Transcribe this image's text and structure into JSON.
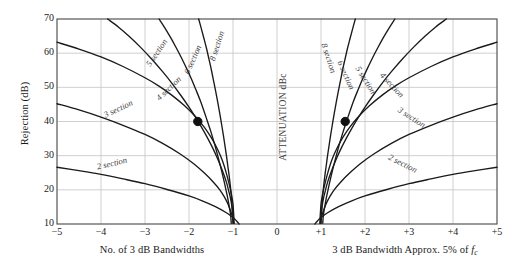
{
  "figure": {
    "center_annotation": "ATTENUATION dBc",
    "ylabel": "Rejection (dB)",
    "xlabel_left": "No. of 3 dB Bandwidths",
    "xlabel_right_pre": "3 dB Bandwidth Approx. 5% of ",
    "xlabel_right_italic": "f",
    "xlabel_right_sub": "c"
  },
  "chart_data": {
    "type": "line",
    "title": "",
    "xlabel": "No. of 3 dB Bandwidths / 3 dB Bandwidth Approx. 5% of fc",
    "ylabel": "Rejection (dB)",
    "xlim": [
      -5,
      5
    ],
    "ylim": [
      70,
      10
    ],
    "y_inverted": true,
    "grid": true,
    "legend": "inline-curve-labels",
    "xticks": [
      "-5",
      "-4",
      "-3",
      "-2",
      "-1",
      "0",
      "+1",
      "+2",
      "+3",
      "+4",
      "+5"
    ],
    "xtick_values": [
      -5,
      -4,
      -3,
      -2,
      -1,
      0,
      1,
      2,
      3,
      4,
      5
    ],
    "yticks": [
      "10",
      "20",
      "30",
      "40",
      "50",
      "60",
      "70"
    ],
    "ytick_values": [
      10,
      20,
      30,
      40,
      50,
      60,
      70
    ],
    "markers": [
      {
        "x": -1.8,
        "y": 40,
        "label": ""
      },
      {
        "x": 1.55,
        "y": 40,
        "label": ""
      }
    ],
    "series": [
      {
        "name": "2 section",
        "side": "left",
        "label": "2 section",
        "label_x": -3.75,
        "label_y": 27.5,
        "label_rotation": -13,
        "points": [
          [
            -5,
            26.6
          ],
          [
            -4.5,
            25.6
          ],
          [
            -4,
            24.5
          ],
          [
            -3.5,
            23.2
          ],
          [
            -3,
            21.8
          ],
          [
            -2.5,
            20.1
          ],
          [
            -2,
            18.2
          ],
          [
            -1.7,
            16.8
          ],
          [
            -1.4,
            15.1
          ],
          [
            -1.15,
            13.3
          ],
          [
            -1.0,
            11.9
          ],
          [
            -0.92,
            10.9
          ],
          [
            -0.86,
            10.0
          ]
        ]
      },
      {
        "name": "3 section",
        "side": "left",
        "label": "3 section",
        "label_x": -3.6,
        "label_y": 43.5,
        "label_rotation": -25,
        "points": [
          [
            -5,
            45.2
          ],
          [
            -4.5,
            43.4
          ],
          [
            -4,
            41.3
          ],
          [
            -3.5,
            38.9
          ],
          [
            -3,
            36.2
          ],
          [
            -2.6,
            33.6
          ],
          [
            -2.2,
            30.5
          ],
          [
            -1.9,
            27.7
          ],
          [
            -1.65,
            24.9
          ],
          [
            -1.45,
            22.3
          ],
          [
            -1.3,
            20.0
          ],
          [
            -1.2,
            18.0
          ],
          [
            -1.12,
            16.0
          ],
          [
            -1.06,
            14.0
          ],
          [
            -1.01,
            12.0
          ],
          [
            -0.98,
            10.2
          ]
        ]
      },
      {
        "name": "4 section",
        "side": "left",
        "label": "4 section",
        "label_x": -2.45,
        "label_y": 49.5,
        "label_rotation": -44,
        "points": [
          [
            -5,
            63.2
          ],
          [
            -4.5,
            61.2
          ],
          [
            -4,
            58.9
          ],
          [
            -3.5,
            56.1
          ],
          [
            -3,
            52.8
          ],
          [
            -2.7,
            50.5
          ],
          [
            -2.4,
            47.8
          ],
          [
            -2.1,
            44.6
          ],
          [
            -1.85,
            41.4
          ],
          [
            -1.65,
            38.3
          ],
          [
            -1.5,
            35.4
          ],
          [
            -1.38,
            32.6
          ],
          [
            -1.28,
            29.8
          ],
          [
            -1.2,
            27.0
          ],
          [
            -1.14,
            24.3
          ],
          [
            -1.09,
            21.8
          ],
          [
            -1.05,
            19.6
          ],
          [
            -1.02,
            17.6
          ],
          [
            -1.0,
            15.8
          ],
          [
            -0.99,
            14.0
          ],
          [
            -0.98,
            12.0
          ],
          [
            -0.975,
            10.2
          ]
        ]
      },
      {
        "name": "5 section",
        "side": "left",
        "label": "5 section",
        "label_x": -2.72,
        "label_y": 60.0,
        "label_rotation": -56,
        "points": [
          [
            -3.85,
            70
          ],
          [
            -3.6,
            67.6
          ],
          [
            -3.35,
            64.8
          ],
          [
            -3.1,
            61.7
          ],
          [
            -2.85,
            58.3
          ],
          [
            -2.6,
            54.6
          ],
          [
            -2.4,
            51.4
          ],
          [
            -2.2,
            47.9
          ],
          [
            -2.0,
            44.2
          ],
          [
            -1.85,
            41.2
          ],
          [
            -1.7,
            38.0
          ],
          [
            -1.58,
            35.2
          ],
          [
            -1.46,
            32.2
          ],
          [
            -1.36,
            29.4
          ],
          [
            -1.28,
            26.9
          ],
          [
            -1.2,
            24.2
          ],
          [
            -1.14,
            21.8
          ],
          [
            -1.1,
            19.8
          ],
          [
            -1.06,
            17.7
          ],
          [
            -1.03,
            15.6
          ],
          [
            -1.01,
            13.4
          ],
          [
            -1.0,
            11.4
          ],
          [
            -0.995,
            10.2
          ]
        ]
      },
      {
        "name": "6 section",
        "side": "left",
        "label": "6 section",
        "label_x": -1.9,
        "label_y": 58.0,
        "label_rotation": -66,
        "points": [
          [
            -2.68,
            70
          ],
          [
            -2.55,
            67.4
          ],
          [
            -2.42,
            64.6
          ],
          [
            -2.3,
            61.8
          ],
          [
            -2.17,
            58.6
          ],
          [
            -2.05,
            55.4
          ],
          [
            -1.94,
            52.3
          ],
          [
            -1.84,
            49.2
          ],
          [
            -1.74,
            46.0
          ],
          [
            -1.66,
            43.1
          ],
          [
            -1.58,
            40.0
          ],
          [
            -1.5,
            36.9
          ],
          [
            -1.43,
            33.9
          ],
          [
            -1.37,
            31.1
          ],
          [
            -1.31,
            28.2
          ],
          [
            -1.26,
            25.6
          ],
          [
            -1.21,
            22.9
          ],
          [
            -1.17,
            20.6
          ],
          [
            -1.13,
            18.2
          ],
          [
            -1.1,
            16.2
          ],
          [
            -1.07,
            14.0
          ],
          [
            -1.05,
            12.1
          ],
          [
            -1.04,
            10.2
          ]
        ]
      },
      {
        "name": "8 section",
        "side": "left",
        "label": "8 section",
        "label_x": -1.35,
        "label_y": 62.0,
        "label_rotation": -72,
        "points": [
          [
            -1.78,
            70
          ],
          [
            -1.72,
            67.2
          ],
          [
            -1.66,
            64.3
          ],
          [
            -1.6,
            61.3
          ],
          [
            -1.545,
            58.2
          ],
          [
            -1.49,
            55.0
          ],
          [
            -1.44,
            51.8
          ],
          [
            -1.39,
            48.6
          ],
          [
            -1.345,
            45.5
          ],
          [
            -1.3,
            42.3
          ],
          [
            -1.26,
            39.2
          ],
          [
            -1.22,
            36.1
          ],
          [
            -1.185,
            33.1
          ],
          [
            -1.15,
            30.1
          ],
          [
            -1.12,
            27.2
          ],
          [
            -1.09,
            24.4
          ],
          [
            -1.065,
            21.7
          ],
          [
            -1.045,
            19.2
          ],
          [
            -1.03,
            16.7
          ],
          [
            -1.015,
            14.2
          ],
          [
            -1.005,
            12.0
          ],
          [
            -1.0,
            10.2
          ]
        ]
      },
      {
        "name": "2 section",
        "side": "right",
        "label": "2 section",
        "label_x": 2.85,
        "label_y": 27.5,
        "label_rotation": 27,
        "points": [
          [
            0.86,
            10.0
          ],
          [
            0.92,
            10.9
          ],
          [
            1.0,
            11.9
          ],
          [
            1.15,
            13.3
          ],
          [
            1.4,
            15.1
          ],
          [
            1.7,
            16.8
          ],
          [
            2.0,
            18.2
          ],
          [
            2.5,
            20.1
          ],
          [
            3.0,
            21.8
          ],
          [
            3.5,
            23.2
          ],
          [
            4.0,
            24.5
          ],
          [
            4.5,
            25.6
          ],
          [
            5,
            26.6
          ]
        ]
      },
      {
        "name": "3 section",
        "side": "right",
        "label": "3 section",
        "label_x": 3.05,
        "label_y": 41.0,
        "label_rotation": 33,
        "points": [
          [
            0.98,
            10.2
          ],
          [
            1.01,
            12.0
          ],
          [
            1.06,
            14.0
          ],
          [
            1.12,
            16.0
          ],
          [
            1.2,
            18.0
          ],
          [
            1.3,
            20.0
          ],
          [
            1.45,
            22.3
          ],
          [
            1.65,
            24.9
          ],
          [
            1.9,
            27.7
          ],
          [
            2.2,
            30.5
          ],
          [
            2.6,
            33.6
          ],
          [
            3.0,
            36.2
          ],
          [
            3.5,
            38.9
          ],
          [
            4.0,
            41.3
          ],
          [
            4.5,
            43.4
          ],
          [
            5,
            45.2
          ]
        ]
      },
      {
        "name": "4 section",
        "side": "right",
        "label": "4 section",
        "label_x": 2.6,
        "label_y": 50.5,
        "label_rotation": 47,
        "points": [
          [
            0.975,
            10.2
          ],
          [
            0.98,
            12.0
          ],
          [
            0.99,
            14.0
          ],
          [
            1.0,
            15.8
          ],
          [
            1.02,
            17.6
          ],
          [
            1.05,
            19.6
          ],
          [
            1.09,
            21.8
          ],
          [
            1.14,
            24.3
          ],
          [
            1.2,
            27.0
          ],
          [
            1.28,
            29.8
          ],
          [
            1.38,
            32.6
          ],
          [
            1.5,
            35.4
          ],
          [
            1.65,
            38.3
          ],
          [
            1.85,
            41.4
          ],
          [
            2.1,
            44.6
          ],
          [
            2.4,
            47.8
          ],
          [
            2.7,
            50.5
          ],
          [
            3.0,
            52.8
          ],
          [
            3.5,
            56.1
          ],
          [
            4.0,
            58.9
          ],
          [
            4.5,
            61.2
          ],
          [
            5,
            63.2
          ]
        ]
      },
      {
        "name": "5 section",
        "side": "right",
        "label": "5 section",
        "label_x": 2.0,
        "label_y": 52.0,
        "label_rotation": 58,
        "points": [
          [
            0.995,
            10.2
          ],
          [
            1.0,
            11.4
          ],
          [
            1.01,
            13.4
          ],
          [
            1.03,
            15.6
          ],
          [
            1.06,
            17.7
          ],
          [
            1.1,
            19.8
          ],
          [
            1.14,
            21.8
          ],
          [
            1.2,
            24.2
          ],
          [
            1.28,
            26.9
          ],
          [
            1.36,
            29.4
          ],
          [
            1.46,
            32.2
          ],
          [
            1.58,
            35.2
          ],
          [
            1.7,
            38.0
          ],
          [
            1.85,
            41.2
          ],
          [
            2.0,
            44.2
          ],
          [
            2.2,
            47.9
          ],
          [
            2.4,
            51.4
          ],
          [
            2.6,
            54.6
          ],
          [
            2.85,
            58.3
          ],
          [
            3.1,
            61.7
          ],
          [
            3.35,
            64.8
          ],
          [
            3.6,
            67.6
          ],
          [
            3.85,
            70
          ]
        ]
      },
      {
        "name": "6 section",
        "side": "right",
        "label": "6 section",
        "label_x": 1.55,
        "label_y": 53.5,
        "label_rotation": 66,
        "points": [
          [
            1.04,
            10.2
          ],
          [
            1.05,
            12.1
          ],
          [
            1.07,
            14.0
          ],
          [
            1.1,
            16.2
          ],
          [
            1.13,
            18.2
          ],
          [
            1.17,
            20.6
          ],
          [
            1.21,
            22.9
          ],
          [
            1.26,
            25.6
          ],
          [
            1.31,
            28.2
          ],
          [
            1.37,
            31.1
          ],
          [
            1.43,
            33.9
          ],
          [
            1.5,
            36.9
          ],
          [
            1.58,
            40.0
          ],
          [
            1.66,
            43.1
          ],
          [
            1.74,
            46.0
          ],
          [
            1.84,
            49.2
          ],
          [
            1.94,
            52.3
          ],
          [
            2.05,
            55.4
          ],
          [
            2.17,
            58.6
          ],
          [
            2.3,
            61.8
          ],
          [
            2.42,
            64.6
          ],
          [
            2.55,
            67.4
          ],
          [
            2.68,
            70
          ]
        ]
      },
      {
        "name": "8 section",
        "side": "right",
        "label": "8 section",
        "label_x": 1.16,
        "label_y": 58.5,
        "label_rotation": 72,
        "points": [
          [
            1.0,
            10.2
          ],
          [
            1.005,
            12.0
          ],
          [
            1.015,
            14.2
          ],
          [
            1.03,
            16.7
          ],
          [
            1.045,
            19.2
          ],
          [
            1.065,
            21.7
          ],
          [
            1.09,
            24.4
          ],
          [
            1.12,
            27.2
          ],
          [
            1.15,
            30.1
          ],
          [
            1.185,
            33.1
          ],
          [
            1.22,
            36.1
          ],
          [
            1.26,
            39.2
          ],
          [
            1.3,
            42.3
          ],
          [
            1.345,
            45.5
          ],
          [
            1.39,
            48.6
          ],
          [
            1.44,
            51.8
          ],
          [
            1.49,
            55.0
          ],
          [
            1.545,
            58.2
          ],
          [
            1.6,
            61.3
          ],
          [
            1.66,
            64.3
          ],
          [
            1.72,
            67.2
          ],
          [
            1.78,
            70
          ]
        ]
      }
    ],
    "colors": {
      "curve": "#1a1a1a",
      "grid": "#c9c9c9",
      "frame": "#555555",
      "marker": "#111111",
      "background": "#ffffff",
      "label_text": "#3c3c3c"
    }
  }
}
